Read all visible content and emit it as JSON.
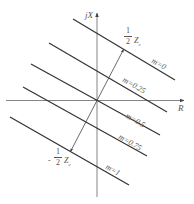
{
  "axes": {
    "x_label": "R",
    "y_label": "jX"
  },
  "lines": [
    {
      "label": "m=0"
    },
    {
      "label": "m=0.25"
    },
    {
      "label": "m=0.5"
    },
    {
      "label": "m=0.75"
    },
    {
      "label": "m=1"
    }
  ],
  "annotations": {
    "top": {
      "num": "1",
      "den": "2",
      "sym": "Z",
      "sub": "c"
    },
    "bottom": {
      "sign": "-",
      "num": "1",
      "den": "2",
      "sym": "Z",
      "sub": "c"
    }
  },
  "colors": {
    "line": "#333333",
    "axis": "#777777",
    "text": "#555555"
  }
}
